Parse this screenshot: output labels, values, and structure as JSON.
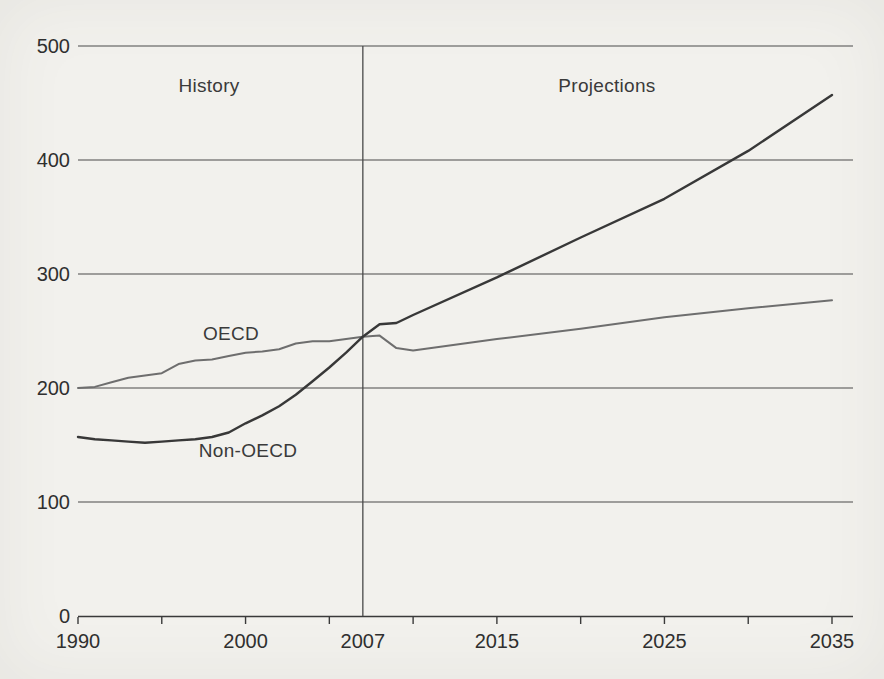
{
  "chart_data": {
    "type": "line",
    "title": "",
    "xlabel": "",
    "ylabel": "",
    "x_range": [
      1990,
      2035
    ],
    "ylim": [
      0,
      500
    ],
    "grid": "horizontal-on",
    "legend_position": "inline-labels",
    "background_color": "#f2f1ed",
    "text_color": "#3a3a3a",
    "grid_color": "#4a4a4a",
    "axis_color": "#3a3a3a",
    "divider_year": 2007,
    "y_ticks": [
      0,
      100,
      200,
      300,
      400,
      500
    ],
    "x_minor_tick_years": [
      1990,
      1995,
      2000,
      2005,
      2010,
      2015,
      2020,
      2025,
      2030,
      2035
    ],
    "x_labels": [
      {
        "year": 1990,
        "text": "1990"
      },
      {
        "year": 2000,
        "text": "2000"
      },
      {
        "year": 2007,
        "text": "2007"
      },
      {
        "year": 2015,
        "text": "2015"
      },
      {
        "year": 2025,
        "text": "2025"
      },
      {
        "year": 2035,
        "text": "2035"
      }
    ],
    "annotations": {
      "history": "History",
      "projections": "Projections"
    },
    "series": [
      {
        "name": "OECD",
        "color": "#6e6e6e",
        "stroke_width": 2,
        "points": [
          [
            1990,
            200
          ],
          [
            1991,
            201
          ],
          [
            1992,
            205
          ],
          [
            1993,
            209
          ],
          [
            1994,
            211
          ],
          [
            1995,
            213
          ],
          [
            1996,
            221
          ],
          [
            1997,
            224
          ],
          [
            1998,
            225
          ],
          [
            1999,
            228
          ],
          [
            2000,
            231
          ],
          [
            2001,
            232
          ],
          [
            2002,
            234
          ],
          [
            2003,
            239
          ],
          [
            2004,
            241
          ],
          [
            2005,
            241
          ],
          [
            2006,
            243
          ],
          [
            2007,
            245
          ],
          [
            2008,
            246
          ],
          [
            2009,
            235
          ],
          [
            2010,
            233
          ],
          [
            2015,
            243
          ],
          [
            2020,
            252
          ],
          [
            2025,
            262
          ],
          [
            2030,
            270
          ],
          [
            2035,
            277
          ]
        ]
      },
      {
        "name": "Non-OECD",
        "color": "#383838",
        "stroke_width": 2.4,
        "points": [
          [
            1990,
            157
          ],
          [
            1991,
            155
          ],
          [
            1992,
            154
          ],
          [
            1993,
            153
          ],
          [
            1994,
            152
          ],
          [
            1995,
            153
          ],
          [
            1996,
            154
          ],
          [
            1997,
            155
          ],
          [
            1998,
            157
          ],
          [
            1999,
            161
          ],
          [
            2000,
            169
          ],
          [
            2001,
            176
          ],
          [
            2002,
            184
          ],
          [
            2003,
            194
          ],
          [
            2004,
            206
          ],
          [
            2005,
            218
          ],
          [
            2006,
            231
          ],
          [
            2007,
            245
          ],
          [
            2008,
            256
          ],
          [
            2009,
            257
          ],
          [
            2010,
            264
          ],
          [
            2015,
            297
          ],
          [
            2020,
            332
          ],
          [
            2025,
            366
          ],
          [
            2030,
            408
          ],
          [
            2035,
            457
          ]
        ]
      }
    ]
  }
}
